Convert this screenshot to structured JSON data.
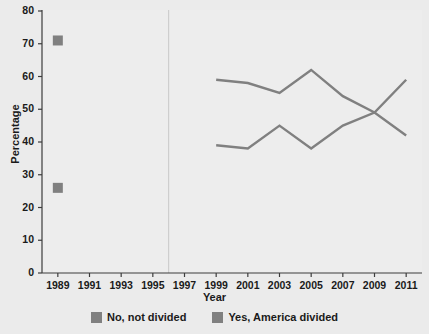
{
  "chart_data": {
    "type": "line",
    "title": "",
    "xlabel": "Year",
    "ylabel": "Percentage",
    "xlim": [
      1988,
      2012
    ],
    "ylim": [
      0,
      80
    ],
    "ytick_labels": [
      "0",
      "10",
      "20",
      "30",
      "40",
      "50",
      "60",
      "70",
      "80"
    ],
    "ytick_values": [
      0,
      10,
      20,
      30,
      40,
      50,
      60,
      70,
      80
    ],
    "xtick_labels": [
      "1989",
      "1991",
      "1993",
      "1995",
      "1997",
      "1999",
      "2001",
      "2003",
      "2005",
      "2007",
      "2009",
      "2011"
    ],
    "xtick_values": [
      1989,
      1991,
      1993,
      1995,
      1997,
      1999,
      2001,
      2003,
      2005,
      2007,
      2009,
      2011
    ],
    "grid": false,
    "legend_position": "bottom",
    "series": [
      {
        "name": "No, not divided",
        "color": "#808080",
        "marker_points": [
          {
            "x": 1989,
            "y": 71
          }
        ],
        "x": [
          1999,
          2001,
          2003,
          2005,
          2007,
          2009,
          2011
        ],
        "values": [
          59,
          58,
          55,
          62,
          54,
          49,
          42
        ]
      },
      {
        "name": "Yes, America divided",
        "color": "#808080",
        "marker_points": [
          {
            "x": 1989,
            "y": 26
          }
        ],
        "x": [
          1999,
          2001,
          2003,
          2005,
          2007,
          2009,
          2011
        ],
        "values": [
          39,
          38,
          45,
          38,
          45,
          49,
          59
        ]
      }
    ],
    "annotations": {
      "break_line_x": 1996
    }
  },
  "legend": {
    "items": [
      {
        "label": "No, not divided",
        "color": "#808080"
      },
      {
        "label": "Yes, America divided",
        "color": "#808080"
      }
    ]
  },
  "colors": {
    "background": "#ebebeb",
    "plot_background": "#ededed",
    "axis": "#3c3c3c",
    "line": "#808080",
    "text": "#1a1a1a"
  }
}
